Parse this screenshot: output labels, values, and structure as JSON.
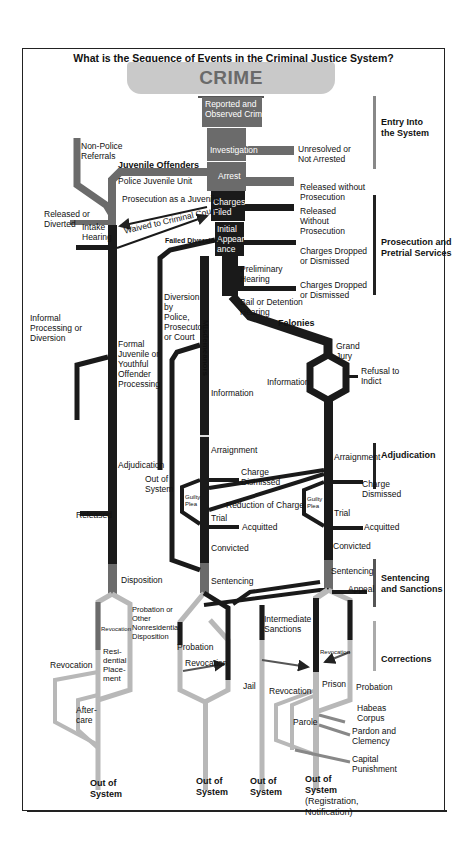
{
  "title": "What is the Sequence of Events in the Criminal Justice System?",
  "banner": "CRIME",
  "sections": [
    {
      "label": "Entry Into the System",
      "line1": "Entry Into",
      "line2": "the System"
    },
    {
      "label": "Prosecution and Pretrial Services",
      "line1": "Prosecution and",
      "line2": "Pretrial Services"
    },
    {
      "label": "Adjudication",
      "line1": "Adjudication",
      "line2": ""
    },
    {
      "label": "Sentencing and Sanctions",
      "line1": "Sentencing",
      "line2": "and Sanctions"
    },
    {
      "label": "Corrections",
      "line1": "Corrections",
      "line2": ""
    }
  ],
  "trunk": {
    "reported": [
      "Reported and",
      "Observed Crime"
    ],
    "investigation": "Investigation",
    "arrest": "Arrest",
    "charges_filed": [
      "Charges",
      "Filed"
    ],
    "initial_appearance": [
      "Initial",
      "Appear-",
      "ance"
    ],
    "preliminary_hearing": [
      "Preliminary",
      "Hearing"
    ],
    "bail_hearing": [
      "Bail or Detention",
      "Hearing"
    ],
    "felonies": "Felonies",
    "misdemeanors": "Misdemeanors",
    "grand_jury": [
      "Grand",
      "Jury"
    ],
    "refusal_to_indict": [
      "Refusal to",
      "Indict"
    ],
    "information_felony": "Information",
    "information_misd": "Information"
  },
  "exits": {
    "unresolved": [
      "Unresolved or",
      "Not Arrested"
    ],
    "released_without_prosecution_1": [
      "Released without",
      "Prosecution"
    ],
    "released_without_prosecution_2": [
      "Released",
      "Without",
      "Prosecution"
    ],
    "charges_dropped_1": [
      "Charges Dropped",
      "or Dismissed"
    ],
    "charges_dropped_2": [
      "Charges Dropped",
      "or Dismissed"
    ]
  },
  "juvenile": {
    "heading": "Juvenile Offenders",
    "non_police": [
      "Non-Police",
      "Referrals"
    ],
    "police_unit": "Police Juvenile Unit",
    "prosecution_as_juvenile": "Prosecution as a Juvenile",
    "waived": "Waived to Criminal Court",
    "released_or_diverted": [
      "Released or",
      "Diverted"
    ],
    "intake": [
      "Intake",
      "Hearing"
    ],
    "informal": [
      "Informal",
      "Processing or",
      "Diversion"
    ],
    "formal": [
      "Formal",
      "Juvenile or",
      "Youthful",
      "Offender",
      "Processing"
    ],
    "adjudication": "Adjudication",
    "released": "Released",
    "disposition": "Disposition",
    "probation_other": [
      "Probation or",
      "Other",
      "Nonresidential",
      "Disposition"
    ],
    "revocation_small": "Revocation",
    "residential": [
      "Resi-",
      "dential",
      "Place-",
      "ment"
    ],
    "revocation": "Revocation",
    "aftercare": [
      "After-",
      "care"
    ],
    "out": [
      "Out of",
      "System"
    ]
  },
  "diversion": {
    "failed": "Failed Diversion",
    "text": [
      "Diversion",
      "by",
      "Police,",
      "Prosecutor",
      "or Court"
    ],
    "out": [
      "Out of",
      "System"
    ]
  },
  "misdemeanor_path": {
    "arraignment": "Arraignment",
    "charge_dismissed": [
      "Charge",
      "Dismissed"
    ],
    "guilty_plea": [
      "Guilty",
      "Plea"
    ],
    "reduction": "Reduction of Charge",
    "trial": "Trial",
    "acquitted": "Acquitted",
    "convicted": "Convicted",
    "sentencing": "Sentencing",
    "probation": "Probation",
    "revocation": "Revocation",
    "jail": "Jail",
    "out": [
      "Out of",
      "System"
    ]
  },
  "felony_path": {
    "arraignment": "Arraignment",
    "charge_dismissed": [
      "Charge",
      "Dismissed"
    ],
    "guilty_plea": [
      "Guilty",
      "Plea"
    ],
    "trial": "Trial",
    "acquitted": "Acquitted",
    "convicted": "Convicted",
    "sentencing": "Sentencing",
    "appeal": "Appeal",
    "intermediate": [
      "Intermediate",
      "Sanctions"
    ],
    "revocation_small": "Revocation",
    "prison": "Prison",
    "probation": "Probation",
    "revocation": "Revocation",
    "habeas": [
      "Habeas",
      "Corpus"
    ],
    "parole": "Parole",
    "pardon": [
      "Pardon and",
      "Clemency"
    ],
    "capital": [
      "Capital",
      "Punishment"
    ],
    "out_intermediate": [
      "Out of",
      "System"
    ],
    "out_prison": [
      "Out of",
      "System",
      "(Registration,",
      "Notification)"
    ]
  },
  "colors": {
    "dark": "#1a1a1a",
    "mid": "#6b6b6b",
    "light": "#b8b8b8",
    "banner": "#c9c9c9",
    "banner_text": "#6a6a6a"
  }
}
